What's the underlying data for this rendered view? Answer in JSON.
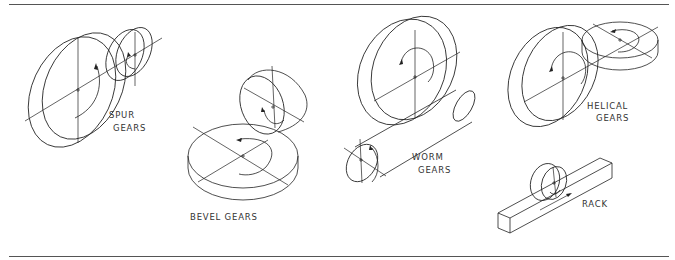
{
  "figure": {
    "labels": {
      "spur": [
        "SPUR",
        "GEARS"
      ],
      "bevel": [
        "BEVEL GEARS"
      ],
      "worm": [
        "WORM",
        "GEARS"
      ],
      "helical": [
        "HELICAL",
        "GEARS"
      ],
      "rack": [
        "RACK"
      ]
    },
    "colors": {
      "line": "#222222",
      "rule": "#555555",
      "background": "#ffffff",
      "text": "#333333"
    },
    "icons": {
      "rotation_arrow": "curved-arrow",
      "center_mark": "x-mark"
    }
  }
}
